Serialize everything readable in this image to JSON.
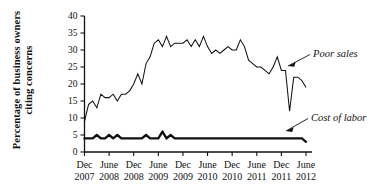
{
  "chart_data": {
    "type": "line",
    "title": "",
    "xlabel": "",
    "ylabel": "Percentage of business owners citing concerns",
    "ylabel_lines": [
      "Percentage of business owners",
      "citing concerns"
    ],
    "ylim": [
      0,
      40
    ],
    "yticks": [
      0,
      5,
      10,
      15,
      20,
      25,
      30,
      35,
      40
    ],
    "ytick_labels": [
      "0",
      "5",
      "10",
      "15",
      "20",
      "25",
      "30",
      "35",
      "40"
    ],
    "grid": false,
    "legend_position": "inline-annotation",
    "xtick_labels": [
      {
        "month": "Dec",
        "year": "2007"
      },
      {
        "month": "June",
        "year": "2008"
      },
      {
        "month": "Dec",
        "year": "2008"
      },
      {
        "month": "June",
        "year": "2009"
      },
      {
        "month": "Dec",
        "year": "2009"
      },
      {
        "month": "June",
        "year": "2010"
      },
      {
        "month": "Dec",
        "year": "2010"
      },
      {
        "month": "June",
        "year": "2011"
      },
      {
        "month": "Dec",
        "year": "2011"
      },
      {
        "month": "June",
        "year": "2012"
      }
    ],
    "x_start": "Dec 2007",
    "x_end": "June 2012",
    "x_interval": "monthly",
    "n_points": 55,
    "series": [
      {
        "name": "Poor sales",
        "annotation": "Poor sales",
        "style": "thin-line",
        "values": [
          9,
          14,
          15,
          13,
          17,
          16,
          16,
          17,
          15,
          17,
          17,
          18,
          20,
          23,
          20,
          26,
          28,
          32,
          33,
          31,
          34,
          31,
          32,
          32,
          32,
          33,
          31,
          33,
          31,
          34,
          31,
          29,
          30,
          29,
          30,
          31,
          30,
          30,
          33,
          31,
          27,
          26,
          25,
          25,
          24,
          23,
          25,
          28,
          24,
          24,
          12,
          22,
          22,
          21,
          19
        ]
      },
      {
        "name": "Cost of labor",
        "annotation": "Cost of labor",
        "style": "thick-line",
        "values": [
          4,
          4,
          4,
          5,
          4,
          4,
          5,
          4,
          5,
          4,
          4,
          4,
          4,
          4,
          4,
          5,
          4,
          4,
          4,
          6,
          4,
          5,
          4,
          4,
          4,
          4,
          4,
          4,
          4,
          4,
          4,
          4,
          4,
          4,
          4,
          4,
          4,
          4,
          4,
          4,
          4,
          4,
          4,
          4,
          4,
          4,
          4,
          4,
          4,
          4,
          4,
          4,
          4,
          4,
          3
        ]
      }
    ],
    "annotations": [
      {
        "text": "Poor sales",
        "target_series": "Poor sales"
      },
      {
        "text": "Cost of labor",
        "target_series": "Cost of labor"
      }
    ]
  }
}
